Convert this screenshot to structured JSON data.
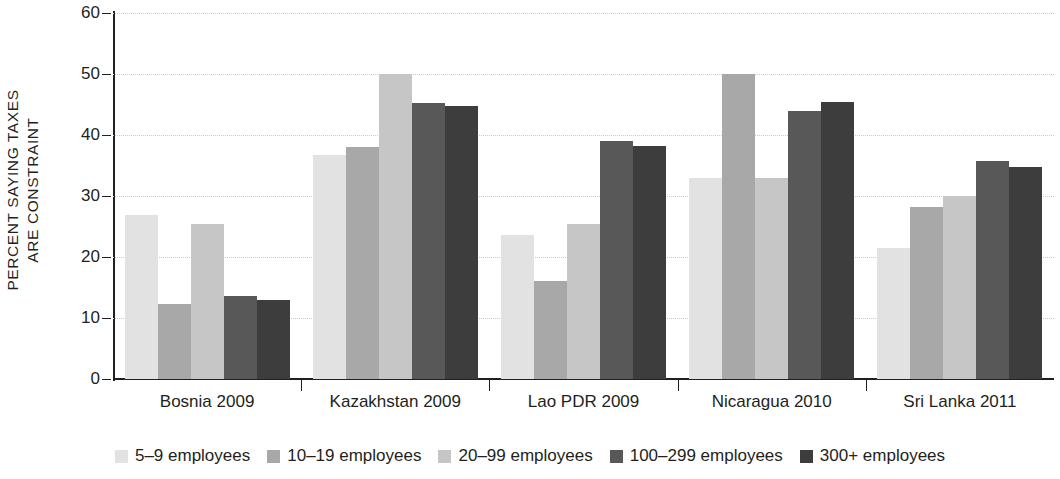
{
  "chart_data": {
    "type": "bar",
    "title": "",
    "subtitle": "",
    "xlabel": "",
    "ylabel": "PERCENT SAYING TAXES ARE CONSTRAINT",
    "ylabel_line1": "PERCENT SAYING TAXES",
    "ylabel_line2": "ARE CONSTRAINT",
    "ylim": [
      0,
      60
    ],
    "ytick_labels": [
      "0",
      "10",
      "20",
      "30",
      "40",
      "50",
      "60"
    ],
    "ytick_values": [
      0,
      10,
      20,
      30,
      40,
      50,
      60
    ],
    "grid": true,
    "grid_axis": "y",
    "legend_position": "bottom",
    "categories": [
      "Bosnia 2009",
      "Kazakhstan 2009",
      "Lao PDR 2009",
      "Nicaragua 2010",
      "Sri Lanka 2011"
    ],
    "series": [
      {
        "name": "5–9 employees",
        "color": "#e2e2e2",
        "values": [
          26.9,
          36.7,
          23.6,
          33.0,
          21.5
        ]
      },
      {
        "name": "10–19 employees",
        "color": "#a8a8a8",
        "values": [
          12.3,
          38.0,
          16.0,
          50.0,
          28.2
        ]
      },
      {
        "name": "20–99 employees",
        "color": "#c6c6c6",
        "values": [
          25.4,
          50.0,
          25.4,
          33.0,
          30.0
        ]
      },
      {
        "name": "100–299 employees",
        "color": "#585858",
        "values": [
          13.6,
          45.3,
          39.1,
          44.0,
          35.8
        ]
      },
      {
        "name": "300+ employees",
        "color": "#3d3d3d",
        "values": [
          13.0,
          44.8,
          38.2,
          45.4,
          34.8
        ]
      }
    ]
  }
}
